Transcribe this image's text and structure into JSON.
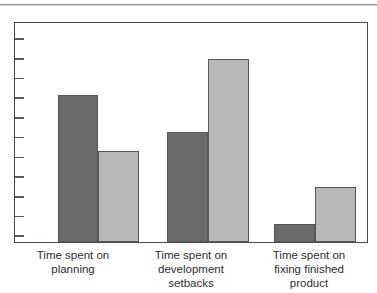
{
  "chart_data": {
    "type": "bar",
    "title": "",
    "subtitle": "",
    "xlabel": "",
    "ylabel": "",
    "ylim": [
      0,
      11
    ],
    "grid": false,
    "legend": "none",
    "axis": {
      "y_tick_count": 11,
      "y_tick_labels": [],
      "x_axis_line": true,
      "y_axis_line": true
    },
    "categories": [
      "Time spent on\nplanning",
      "Time spent on\ndevelopment\nsetbacks",
      "Time spent on\nfixing finished\nproduct"
    ],
    "series": [
      {
        "name": "dark",
        "color": "#6a6a6a",
        "values": [
          7.4,
          5.55,
          0.9
        ]
      },
      {
        "name": "light",
        "color": "#b8b8b8",
        "values": [
          4.6,
          9.25,
          2.75
        ]
      }
    ],
    "bar_geometry": [
      {
        "group": 0,
        "series": 0,
        "left_pct": 12.1,
        "width_pct": 11.6,
        "height_pct": 67.0
      },
      {
        "group": 0,
        "series": 1,
        "left_pct": 23.7,
        "width_pct": 11.6,
        "height_pct": 41.6
      },
      {
        "group": 1,
        "series": 0,
        "left_pct": 43.2,
        "width_pct": 11.6,
        "height_pct": 50.2
      },
      {
        "group": 1,
        "series": 1,
        "left_pct": 54.8,
        "width_pct": 11.6,
        "height_pct": 83.7
      },
      {
        "group": 2,
        "series": 0,
        "left_pct": 73.7,
        "width_pct": 11.6,
        "height_pct": 8.1
      },
      {
        "group": 2,
        "series": 1,
        "left_pct": 85.3,
        "width_pct": 11.6,
        "height_pct": 24.9
      }
    ]
  },
  "colors": {
    "dark_bar": "#6a6a6a",
    "light_bar": "#b8b8b8",
    "bar_border": "#575757",
    "frame": "#4a4a4a",
    "tick": "#5a5a5a",
    "label_text": "#2e2e2e",
    "top_rule": "#8b8b8b",
    "background": "#ffffff"
  },
  "ticks": {
    "positions_pct": [
      7.0,
      16.0,
      25.0,
      34.0,
      43.0,
      52.0,
      61.0,
      70.0,
      79.0,
      88.0,
      97.0
    ]
  }
}
